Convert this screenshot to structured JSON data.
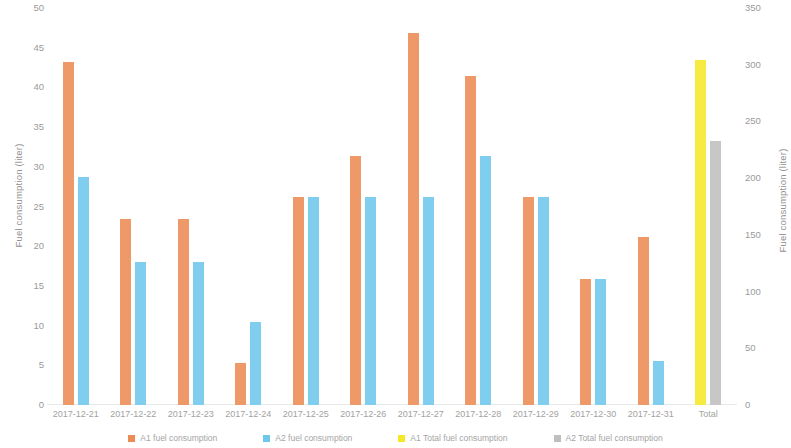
{
  "chart_data": {
    "type": "bar",
    "title": "",
    "xlabel": "",
    "ylabel": "Fuel consumption (liter)",
    "y2label": "Fuel consumption (liter)",
    "ylim": [
      0,
      50
    ],
    "y2lim": [
      0,
      350
    ],
    "yticks": [
      50,
      45,
      40,
      35,
      30,
      25,
      20,
      15,
      10,
      5,
      0
    ],
    "y2ticks": [
      350,
      300,
      250,
      200,
      150,
      100,
      50,
      0
    ],
    "grid": false,
    "legend_position": "bottom",
    "categories": [
      "2017-12-21",
      "2017-12-22",
      "2017-12-23",
      "2017-12-24",
      "2017-12-25",
      "2017-12-26",
      "2017-12-27",
      "2017-12-28",
      "2017-12-29",
      "2017-12-30",
      "2017-12-31",
      "Total"
    ],
    "series": [
      {
        "name": "A1 fuel consumption",
        "color": "#ED8B54",
        "axis": "left",
        "values": [
          43.2,
          23.4,
          23.4,
          5.3,
          26.2,
          31.4,
          46.8,
          41.5,
          26.2,
          15.9,
          21.2,
          null
        ]
      },
      {
        "name": "A2 fuel consumption",
        "color": "#6FC7EC",
        "axis": "left",
        "values": [
          28.7,
          18.0,
          18.0,
          10.5,
          26.2,
          26.2,
          26.2,
          31.3,
          26.2,
          15.9,
          5.5,
          null
        ]
      },
      {
        "name": "A1 Total fuel consumption",
        "color": "#F7E827",
        "axis": "right",
        "values": [
          null,
          null,
          null,
          null,
          null,
          null,
          null,
          null,
          null,
          null,
          null,
          304
        ]
      },
      {
        "name": "A2 Total fuel consumption",
        "color": "#BFBFBF",
        "axis": "right",
        "values": [
          null,
          null,
          null,
          null,
          null,
          null,
          null,
          null,
          null,
          null,
          null,
          233
        ]
      }
    ]
  }
}
